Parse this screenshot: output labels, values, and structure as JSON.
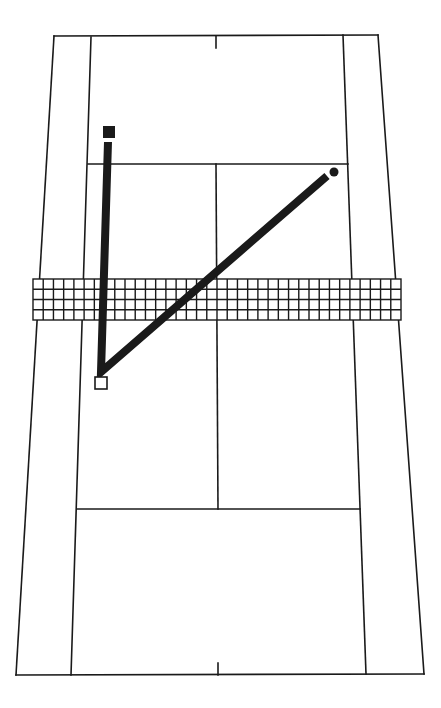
{
  "diagram": {
    "colors": {
      "background": "#ffffff",
      "ink": "#1a1a1a"
    },
    "court": {
      "baseline_top": {
        "x1": 54,
        "y1": 36,
        "x2": 378,
        "y2": 35
      },
      "baseline_bottom": {
        "x1": 16,
        "y1": 675,
        "x2": 424,
        "y2": 674
      },
      "doubles_left": {
        "x1": 54,
        "y1": 36,
        "x2": 16,
        "y2": 675
      },
      "doubles_right": {
        "x1": 378,
        "y1": 35,
        "x2": 424,
        "y2": 674
      },
      "singles_left": {
        "x1": 91,
        "y1": 37,
        "x2": 71,
        "y2": 675
      },
      "singles_right": {
        "x1": 343,
        "y1": 35,
        "x2": 366,
        "y2": 674
      },
      "service_line_top": {
        "x1": 88,
        "y1": 164,
        "x2": 348,
        "y2": 164
      },
      "service_line_bottom": {
        "x1": 77,
        "y1": 509,
        "x2": 360,
        "y2": 509
      },
      "center_service_line": {
        "x1": 216,
        "y1": 164,
        "x2": 218,
        "y2": 509
      },
      "center_mark_top": {
        "x1": 216,
        "y1": 36,
        "x2": 216,
        "y2": 48
      },
      "center_mark_bottom": {
        "x1": 218,
        "y1": 663,
        "x2": 218,
        "y2": 675
      }
    },
    "net": {
      "x": 33,
      "y": 279,
      "width": 368,
      "height": 41,
      "rows": 4,
      "columns": 36
    },
    "markers": {
      "player_far": {
        "shape": "filled-square",
        "x": 103,
        "y": 126,
        "size": 12
      },
      "player_near": {
        "shape": "hollow-square",
        "x": 95,
        "y": 377,
        "size": 12
      },
      "ball": {
        "shape": "filled-circle",
        "cx": 334,
        "cy": 172,
        "r": 4.5
      }
    },
    "shot_path": {
      "points": [
        [
          108,
          142
        ],
        [
          101,
          372
        ],
        [
          327,
          176
        ]
      ]
    }
  }
}
